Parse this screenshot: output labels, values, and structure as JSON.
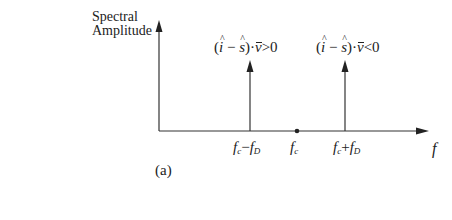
{
  "figure": {
    "y_axis_label_line1": "Spectral",
    "y_axis_label_line2": "Amplitude",
    "x_axis_label": "f",
    "panel_label": "(a)",
    "spikes": [
      {
        "position_label_main": "f",
        "position_label_sub1": "c",
        "position_label_op": "−",
        "position_label_main2": "f",
        "position_label_sub2": "D",
        "condition": {
          "open": "(",
          "i": "i",
          "minus": " − ",
          "s": "s",
          "close": ")·",
          "v": "v",
          "rel": ">0"
        }
      },
      {
        "position_label_main": "f",
        "position_label_sub1": "c",
        "position_label_op": "+",
        "position_label_main2": "f",
        "position_label_sub2": "D",
        "condition": {
          "open": "(",
          "i": "i",
          "minus": " − ",
          "s": "s",
          "close": ")·",
          "v": "v",
          "rel": "<0"
        }
      }
    ],
    "center": {
      "main": "f",
      "sub": "c"
    },
    "colors": {
      "ink": "#222222",
      "background": "#ffffff"
    }
  }
}
